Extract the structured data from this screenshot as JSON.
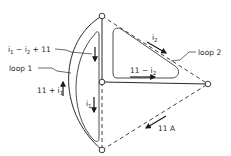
{
  "diagram": {
    "type": "circuit-current-loops",
    "labels": {
      "i1_minus_i2_plus_11": {
        "main": "i",
        "sub1": "1",
        "mid": " − i",
        "sub2": "2",
        "tail": " + 11"
      },
      "loop1": "loop 1",
      "eleven_plus_i1": {
        "main": "11 + i",
        "sub": "1"
      },
      "i1": {
        "main": "i",
        "sub": "1"
      },
      "i2": {
        "main": "i",
        "sub": "2"
      },
      "loop2": "loop 2",
      "eleven_minus_i2": {
        "main": "11 − i",
        "sub": "2"
      },
      "source_current": "11 A"
    },
    "nodes": [
      "top",
      "center",
      "bottom",
      "right"
    ],
    "branches": [
      {
        "from": "top",
        "to": "bottom",
        "style": "solid-arc"
      },
      {
        "from": "top",
        "to": "center",
        "style": "solid"
      },
      {
        "from": "center",
        "to": "bottom",
        "style": "dashed"
      },
      {
        "from": "center",
        "to": "right",
        "style": "solid"
      },
      {
        "from": "top",
        "to": "right",
        "style": "dashed"
      },
      {
        "from": "bottom",
        "to": "right",
        "style": "dashed"
      }
    ],
    "colors": {
      "ink": "#2a2a2a",
      "background": "#ffffff"
    }
  }
}
